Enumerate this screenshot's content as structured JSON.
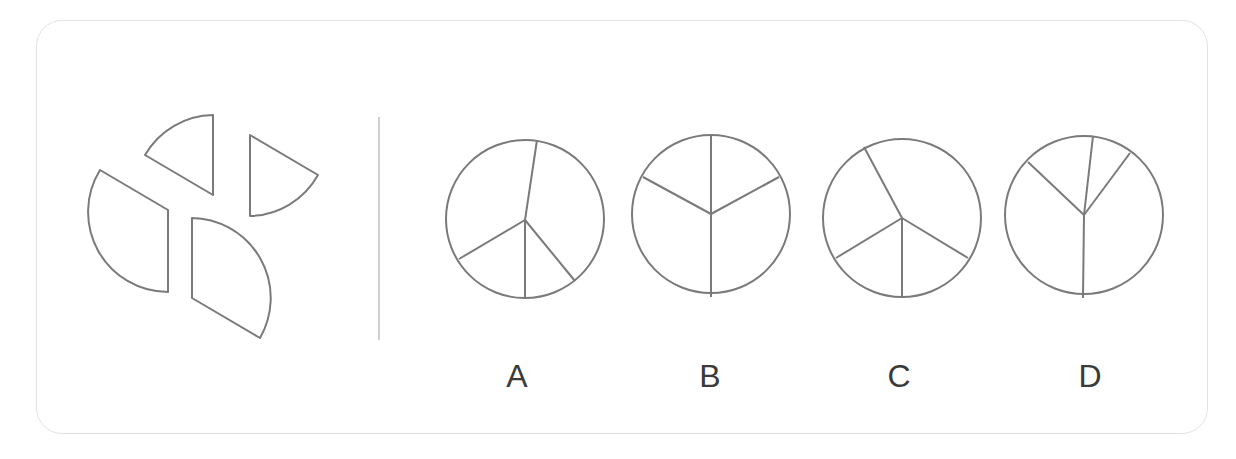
{
  "puzzle": {
    "question_pieces": [
      {
        "id": "piece-top",
        "path": "M213,195 L213,115 A80,80 0 0 0 145,155 Z"
      },
      {
        "id": "piece-right",
        "path": "M250,216 L250,135 L318,175 A80,80 0 0 1 250,216 Z"
      },
      {
        "id": "piece-left",
        "path": "M168,210 L100,170 A80,80 0 0 0 168,292 Z"
      },
      {
        "id": "piece-bottom",
        "path": "M192,218 L192,298 L260,338 A80,80 0 0 0 192,218 Z"
      }
    ],
    "colors": {
      "stroke": "#7a7a7a",
      "divider": "#cfcfcf",
      "frame_border": "#e3e3e3",
      "label": "#3a3a3a"
    },
    "options": [
      {
        "label": "A",
        "cx": 525,
        "cy": 219,
        "r": 79,
        "center": [
          525,
          220
        ],
        "spokes": [
          [
            537,
            140
          ],
          [
            459,
            259
          ],
          [
            525,
            298
          ],
          [
            575,
            281
          ]
        ]
      },
      {
        "label": "B",
        "cx": 711,
        "cy": 214,
        "r": 79,
        "center": [
          711,
          214
        ],
        "spokes": [
          [
            711,
            135
          ],
          [
            643,
            177
          ],
          [
            779,
            177
          ],
          [
            711,
            297
          ]
        ]
      },
      {
        "label": "C",
        "cx": 902,
        "cy": 218,
        "r": 79,
        "center": [
          902,
          218
        ],
        "spokes": [
          [
            864,
            147
          ],
          [
            836,
            258
          ],
          [
            902,
            298
          ],
          [
            968,
            258
          ]
        ]
      },
      {
        "label": "D",
        "cx": 1084,
        "cy": 215,
        "r": 79,
        "center": [
          1084,
          215
        ],
        "spokes": [
          [
            1028,
            162
          ],
          [
            1093,
            136
          ],
          [
            1130,
            153
          ],
          [
            1083,
            298
          ]
        ]
      }
    ]
  }
}
